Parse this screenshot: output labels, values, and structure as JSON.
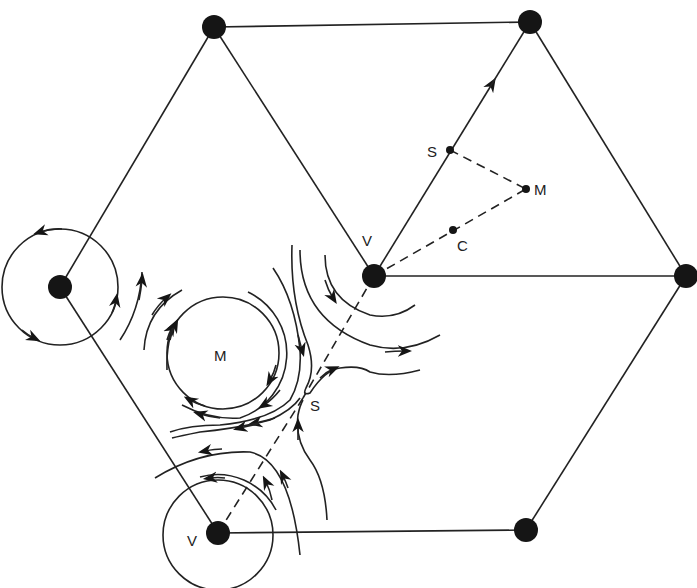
{
  "diagram": {
    "colors": {
      "ink": "#222222",
      "background": "#ffffff"
    },
    "labels": {
      "v_center": "V",
      "v_bottom": "V",
      "m_flow": "M",
      "s_flow": "S",
      "s_edge": "S",
      "m_tri": "M",
      "c_tri": "C"
    },
    "vertices": [
      {
        "id": "top-left",
        "x": 214,
        "y": 27
      },
      {
        "id": "top-right",
        "x": 530,
        "y": 22
      },
      {
        "id": "right",
        "x": 686,
        "y": 276
      },
      {
        "id": "center",
        "x": 374,
        "y": 276
      },
      {
        "id": "left",
        "x": 60,
        "y": 287
      },
      {
        "id": "bottom-left",
        "x": 218,
        "y": 533
      },
      {
        "id": "bottom-right",
        "x": 526,
        "y": 530
      }
    ]
  }
}
